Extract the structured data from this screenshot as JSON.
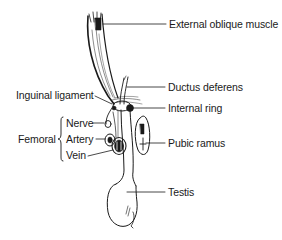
{
  "diagram": {
    "type": "anatomical-illustration",
    "line_color": "#1a1a1a",
    "background": "#ffffff",
    "labels": {
      "external_oblique_muscle": "External oblique muscle",
      "ductus_deferens": "Ductus deferens",
      "internal_ring": "Internal ring",
      "pubic_ramus": "Pubic ramus",
      "testis": "Testis",
      "inguinal_ligament": "Inguinal ligament",
      "femoral_group": "Femoral",
      "femoral_nerve": "Nerve",
      "femoral_artery": "Artery",
      "femoral_vein": "Vein"
    }
  }
}
